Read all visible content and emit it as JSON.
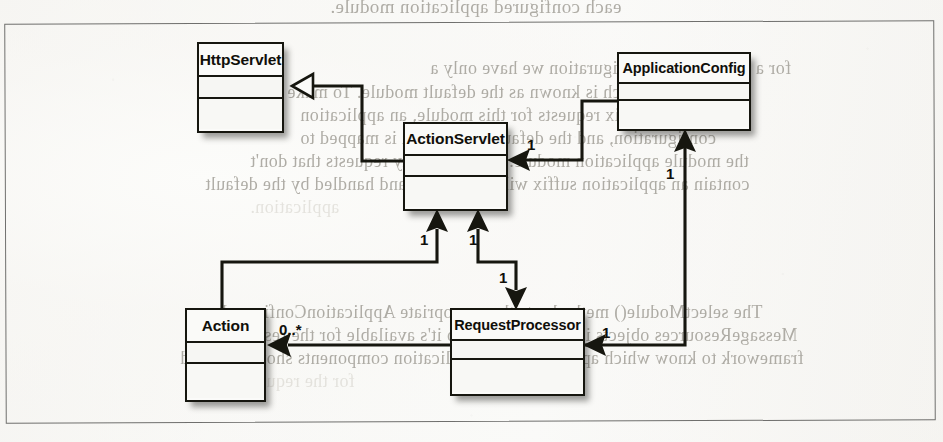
{
  "figure": {
    "kind": "uml-class-diagram",
    "frame_border_color": "#6f6f6d",
    "ink_color": "#16160f",
    "paper_color": "#fbfbf9"
  },
  "classes": [
    {
      "id": "HttpServlet",
      "name": "HttpServlet",
      "x": 197,
      "y": 42,
      "w": 87,
      "h": 91,
      "name_h": 33,
      "attrs_h": 22
    },
    {
      "id": "ActionServlet",
      "name": "ActionServlet",
      "x": 403,
      "y": 122,
      "w": 105,
      "h": 89,
      "name_h": 32,
      "attrs_h": 21
    },
    {
      "id": "ApplicationConfig",
      "name": "ApplicationConfig",
      "x": 617,
      "y": 52,
      "w": 134,
      "h": 79,
      "name_h": 30,
      "attrs_h": 17
    },
    {
      "id": "Action",
      "name": "Action",
      "x": 185,
      "y": 308,
      "w": 81,
      "h": 94,
      "name_h": 33,
      "attrs_h": 21
    },
    {
      "id": "RequestProcessor",
      "name": "RequestProcessor",
      "x": 450,
      "y": 308,
      "w": 135,
      "h": 88,
      "name_h": 31,
      "attrs_h": 19
    }
  ],
  "relationships": [
    {
      "id": "actionservlet-extends-httpservlet",
      "type": "generalization",
      "from": "ActionServlet",
      "to": "HttpServlet",
      "arrowhead": "hollow-triangle",
      "multiplicity": ""
    },
    {
      "id": "applicationconfig-to-actionservlet",
      "type": "association",
      "from": "ApplicationConfig",
      "to": "ActionServlet",
      "arrowhead": "solid-open",
      "multiplicity": "1"
    },
    {
      "id": "requestprocessor-to-applicationconfig",
      "type": "association",
      "from": "RequestProcessor",
      "to": "ApplicationConfig",
      "arrowhead": "solid-open",
      "multiplicity": "1"
    },
    {
      "id": "action-to-actionservlet",
      "type": "association",
      "from": "Action",
      "to": "ActionServlet",
      "arrowhead": "solid-open",
      "multiplicity": "1"
    },
    {
      "id": "actionservlet-to-requestprocessor",
      "type": "association",
      "from": "ActionServlet",
      "to": "RequestProcessor",
      "arrowhead": "solid-open",
      "multiplicity": "1"
    },
    {
      "id": "requestprocessor-to-action",
      "type": "association",
      "from": "RequestProcessor",
      "to": "Action",
      "arrowhead": "solid-open",
      "multiplicity": "0..*"
    }
  ],
  "multiplicity_labels": [
    {
      "id": "mult-appconfig-actionservlet",
      "text": "1",
      "x": 527,
      "y": 137
    },
    {
      "id": "mult-reqproc-appconfig",
      "text": "1",
      "x": 666,
      "y": 166
    },
    {
      "id": "mult-action-actionservlet",
      "text": "1",
      "x": 420,
      "y": 232
    },
    {
      "id": "mult-actionservlet-reqproc-a",
      "text": "1",
      "x": 469,
      "y": 232
    },
    {
      "id": "mult-actionservlet-reqproc-b",
      "text": "1",
      "x": 499,
      "y": 270
    },
    {
      "id": "mult-reqproc-action",
      "text": "0..*",
      "x": 279,
      "y": 322
    },
    {
      "id": "mult-reqproc-appconfig-lower",
      "text": "1",
      "x": 602,
      "y": 325
    }
  ],
  "background_bleed": {
    "note": "faint mirrored show-through text from the reverse side of the scanned page",
    "lines": [
      {
        "text": "each configured application module.",
        "x": 330,
        "y": -4,
        "size": 19,
        "tone": "dark"
      },
      {
        "text": "for a single Struts configuration we have only a",
        "x": 430,
        "y": 58,
        "size": 18,
        "tone": "dark"
      },
      {
        "text": "application, which is known as the default module. To make key",
        "x": 255,
        "y": 82,
        "size": 18,
        "tone": "dark"
      },
      {
        "text": "module prefix requests for this module, an application",
        "x": 300,
        "y": 105,
        "size": 18,
        "tone": "dark"
      },
      {
        "text": "configuration, and the default application is mapped to",
        "x": 300,
        "y": 128,
        "size": 18,
        "tone": "dark"
      },
      {
        "text": "the module application module. Therefore, any requests that don't",
        "x": 250,
        "y": 151,
        "size": 18,
        "tone": "dark"
      },
      {
        "text": "contain an application suffix will be mapped and handled by the default",
        "x": 205,
        "y": 174,
        "size": 18,
        "tone": "dark"
      },
      {
        "text": "application.",
        "x": 250,
        "y": 197,
        "size": 18,
        "tone": "light"
      },
      {
        "text": "The selectModule() method sets the appropriate ApplicationConfig and",
        "x": 222,
        "y": 302,
        "size": 18,
        "tone": "dark"
      },
      {
        "text": "MessageResources objects into the request, so it's available for the rest of the",
        "x": 210,
        "y": 325,
        "size": 18,
        "tone": "dark"
      },
      {
        "text": "framework to know which application and application components should be used",
        "x": 180,
        "y": 348,
        "size": 18,
        "tone": "dark"
      },
      {
        "text": "for the request.",
        "x": 240,
        "y": 371,
        "size": 18,
        "tone": "light"
      }
    ]
  }
}
